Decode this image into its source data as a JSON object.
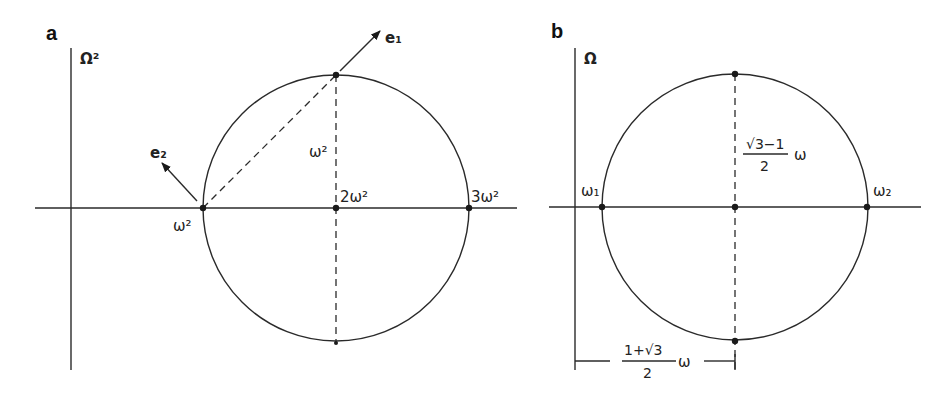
{
  "panels": [
    {
      "id": "a",
      "label": "a",
      "axis_label": "Ω²",
      "points": {
        "left": "ω²",
        "center": "2ω²",
        "right": "3ω²",
        "radius_label": "ω²"
      },
      "vectors": [
        "e₁",
        "e₂"
      ]
    },
    {
      "id": "b",
      "label": "b",
      "axis_label": "Ω",
      "points": {
        "left": "ω₁",
        "right": "ω₂"
      },
      "radius_label": {
        "numerator": "√3−1",
        "denominator": "2",
        "suffix": "ω"
      },
      "center_offset_label": {
        "numerator": "1+√3",
        "denominator": "2",
        "suffix": "ω"
      }
    }
  ]
}
